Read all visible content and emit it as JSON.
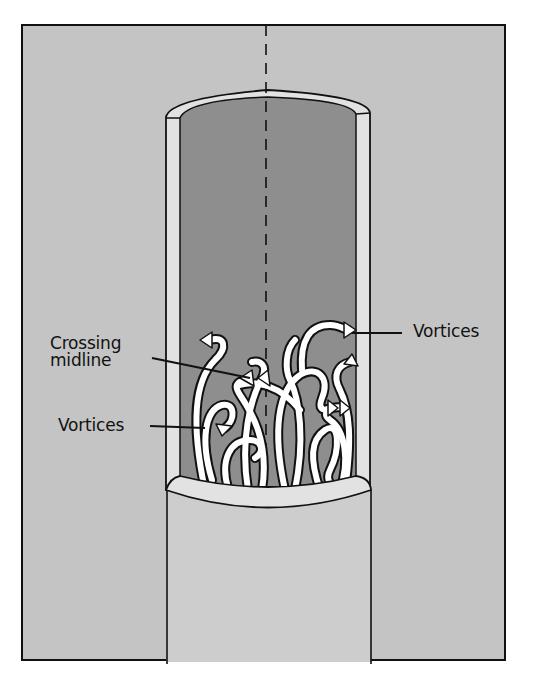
{
  "figure": {
    "colors": {
      "background": "#ffffff",
      "outer_panel": "#c4c4c4",
      "tube_wall": "#e2e2e2",
      "lumen": "#8e8e8e",
      "lower_tube": "#cdcdcd",
      "outline": "#111111",
      "arrow_fill": "#ffffff"
    }
  },
  "labels": {
    "crossing_midline_line1": "Crossing",
    "crossing_midline_line2": "midline",
    "vortices_left": "Vortices",
    "vortices_right": "Vortices"
  }
}
